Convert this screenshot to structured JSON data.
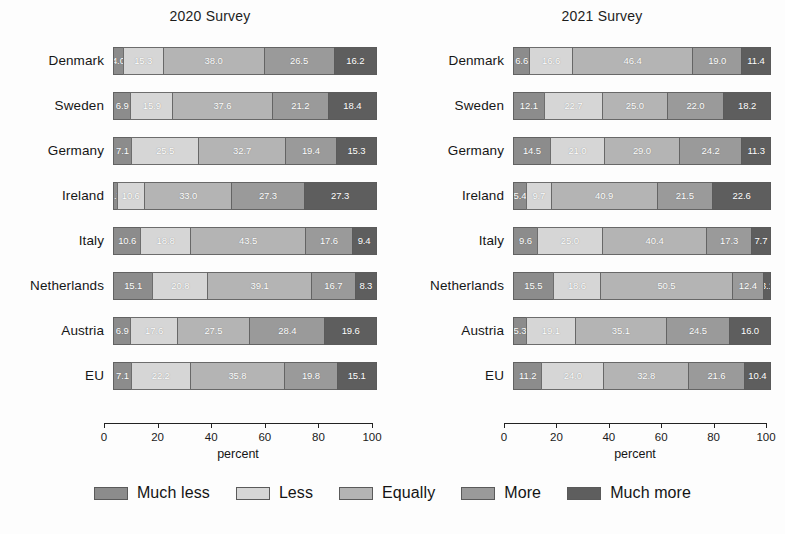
{
  "figure": {
    "axis_title": "percent",
    "x_ticks": [
      0,
      20,
      40,
      60,
      80,
      100
    ],
    "x_min": 0,
    "x_max": 100
  },
  "legend": {
    "items": [
      {
        "label": "Much less",
        "color": "#8c8c8c"
      },
      {
        "label": "Less",
        "color": "#d6d6d6"
      },
      {
        "label": "Equally",
        "color": "#b4b4b4"
      },
      {
        "label": "More",
        "color": "#9a9a9a"
      },
      {
        "label": "Much more",
        "color": "#5e5e5e"
      }
    ]
  },
  "chart_data": [
    {
      "type": "bar",
      "orientation": "horizontal",
      "stacked": true,
      "stacked_percent": true,
      "title": "2020 Survey",
      "xlabel": "percent",
      "ylabel": "",
      "xlim": [
        0,
        100
      ],
      "xticks": [
        0,
        20,
        40,
        60,
        80,
        100
      ],
      "grid": false,
      "legend_position": "bottom",
      "categories": [
        "Denmark",
        "Sweden",
        "Germany",
        "Ireland",
        "Italy",
        "Netherlands",
        "Austria",
        "EU"
      ],
      "series": [
        {
          "name": "Much less",
          "color": "#8c8c8c",
          "values": [
            4.0,
            6.9,
            7.1,
            1.7,
            10.6,
            15.1,
            6.9,
            7.1
          ]
        },
        {
          "name": "Less",
          "color": "#d6d6d6",
          "values": [
            15.3,
            15.9,
            25.5,
            10.6,
            18.8,
            20.8,
            17.6,
            22.2
          ]
        },
        {
          "name": "Equally",
          "color": "#b4b4b4",
          "values": [
            38.0,
            37.6,
            32.7,
            33.0,
            43.5,
            39.1,
            27.5,
            35.8
          ]
        },
        {
          "name": "More",
          "color": "#9a9a9a",
          "values": [
            26.5,
            21.2,
            19.4,
            27.3,
            17.6,
            16.7,
            28.4,
            19.8
          ]
        },
        {
          "name": "Much more",
          "color": "#5e5e5e",
          "values": [
            16.2,
            18.4,
            15.3,
            27.3,
            9.4,
            8.3,
            19.6,
            15.1
          ]
        }
      ]
    },
    {
      "type": "bar",
      "orientation": "horizontal",
      "stacked": true,
      "stacked_percent": true,
      "title": "2021 Survey",
      "xlabel": "percent",
      "ylabel": "",
      "xlim": [
        0,
        100
      ],
      "xticks": [
        0,
        20,
        40,
        60,
        80,
        100
      ],
      "grid": false,
      "legend_position": "bottom",
      "categories": [
        "Denmark",
        "Sweden",
        "Germany",
        "Ireland",
        "Italy",
        "Netherlands",
        "Austria",
        "EU"
      ],
      "series": [
        {
          "name": "Much less",
          "color": "#8c8c8c",
          "values": [
            6.6,
            12.1,
            14.5,
            5.4,
            9.6,
            15.5,
            5.3,
            11.2
          ]
        },
        {
          "name": "Less",
          "color": "#d6d6d6",
          "values": [
            16.6,
            22.7,
            21.0,
            9.7,
            25.0,
            18.6,
            19.1,
            24.0
          ]
        },
        {
          "name": "Equally",
          "color": "#b4b4b4",
          "values": [
            46.4,
            25.0,
            29.0,
            40.9,
            40.4,
            50.5,
            35.1,
            32.8
          ]
        },
        {
          "name": "More",
          "color": "#9a9a9a",
          "values": [
            19.0,
            22.0,
            24.2,
            21.5,
            17.3,
            12.4,
            24.5,
            21.6
          ]
        },
        {
          "name": "Much more",
          "color": "#5e5e5e",
          "values": [
            11.4,
            18.2,
            11.3,
            22.6,
            7.7,
            3.1,
            16.0,
            10.4
          ]
        }
      ]
    }
  ]
}
